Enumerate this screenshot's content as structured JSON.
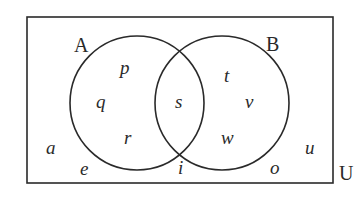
{
  "diagram": {
    "type": "venn",
    "universe_label": "U",
    "sets": [
      {
        "name": "A"
      },
      {
        "name": "B"
      }
    ],
    "regions": {
      "A_only": [
        "p",
        "q",
        "r"
      ],
      "A_and_B": [
        "s"
      ],
      "B_only": [
        "t",
        "v",
        "w"
      ],
      "outside": [
        "a",
        "e",
        "i",
        "o",
        "u"
      ]
    },
    "labels": {
      "set_a": "A",
      "set_b": "B",
      "universe": "U",
      "p": "p",
      "q": "q",
      "r": "r",
      "s": "s",
      "t": "t",
      "v": "v",
      "w": "w",
      "a": "a",
      "e": "e",
      "i": "i",
      "o": "o",
      "u": "u"
    },
    "colors": {
      "stroke": "#2a2a2a",
      "background": "#ffffff"
    }
  }
}
